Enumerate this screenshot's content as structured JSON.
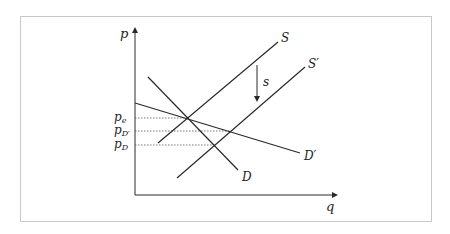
{
  "figure": {
    "axes": {
      "y_label": "p",
      "x_label": "q"
    },
    "curves": [
      {
        "id": "S",
        "label": "S",
        "kind": "supply"
      },
      {
        "id": "S_prime",
        "label": "S′",
        "kind": "supply-shifted"
      },
      {
        "id": "D",
        "label": "D",
        "kind": "demand"
      },
      {
        "id": "D_prime",
        "label": "D′",
        "kind": "demand-flatter"
      }
    ],
    "shift_arrow": {
      "label": "s",
      "direction": "down"
    },
    "price_levels": [
      {
        "id": "pe",
        "base": "p",
        "sub": "e"
      },
      {
        "id": "pD_prime",
        "base": "p",
        "sub": "D′"
      },
      {
        "id": "pD",
        "base": "p",
        "sub": "D"
      }
    ],
    "colors": {
      "line": "#2a2a2a",
      "dotted": "#555555",
      "frame": "#c8c8c8"
    }
  }
}
